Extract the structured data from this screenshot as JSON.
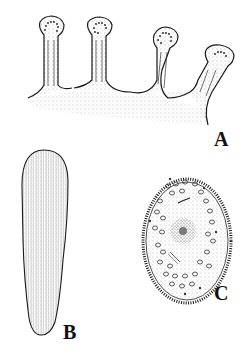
{
  "figure": {
    "panels": [
      {
        "id": "A",
        "label": "A",
        "description": "finger-like projections with knobbed tips"
      },
      {
        "id": "B",
        "label": "B",
        "description": "elongated striated body"
      },
      {
        "id": "C",
        "label": "C",
        "description": "oval ciliated cell with central nucleus"
      }
    ],
    "colors": {
      "ink": "#1a1a1a",
      "background": "#ffffff",
      "stipple": "#555555"
    }
  }
}
